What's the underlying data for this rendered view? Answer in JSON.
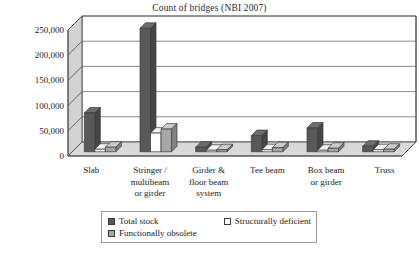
{
  "chart_data": {
    "type": "bar",
    "title": "Count of bridges (NBI 2007)",
    "xlabel": "",
    "ylabel": "",
    "ylim": [
      0,
      250000
    ],
    "yticks": [
      0,
      50000,
      100000,
      150000,
      200000,
      250000
    ],
    "ytick_labels": [
      "0",
      "50,000",
      "100,000",
      "150,000",
      "200,000",
      "250,000"
    ],
    "grid": true,
    "legend_position": "bottom",
    "style": "3d-clustered-column",
    "categories": [
      "Slab",
      "Stringer / multibeam or girder",
      "Girder & floor beam system",
      "Tee beam",
      "Box beam or girder",
      "Truss"
    ],
    "category_lines": [
      [
        "Slab"
      ],
      [
        "Stringer /",
        "multibeam",
        "or girder"
      ],
      [
        "Girder &",
        "floor beam",
        "system"
      ],
      [
        "Tee beam"
      ],
      [
        "Box beam",
        "or girder"
      ],
      [
        "Truss"
      ]
    ],
    "series": [
      {
        "name": "Total stock",
        "color": "#595959",
        "values": [
          77000,
          245000,
          9000,
          32000,
          47000,
          11000
        ]
      },
      {
        "name": "Structurally deficient",
        "color": "#ffffff",
        "values": [
          5000,
          37000,
          3000,
          4000,
          3000,
          4000
        ]
      },
      {
        "name": "Functionally obsolete",
        "color": "#a6a6a6",
        "values": [
          9000,
          45000,
          4000,
          8000,
          7000,
          5000
        ]
      }
    ]
  },
  "legend": {
    "items": [
      {
        "label": "Total stock",
        "swatch": "#595959"
      },
      {
        "label": "Structurally deficient",
        "swatch": "#ffffff"
      },
      {
        "label": "Functionally obsolete",
        "swatch": "#a6a6a6"
      }
    ]
  },
  "palette": {
    "wall": "#d2d2d2",
    "floor": "#d9d9d9",
    "grid": "#6e6e6e",
    "axis": "#4d4d4d",
    "text": "#1a1a1a"
  }
}
